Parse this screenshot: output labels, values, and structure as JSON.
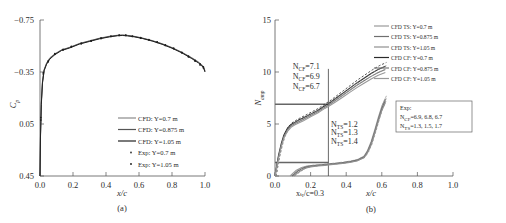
{
  "figure": {
    "caption_a": "(a)",
    "caption_b": "(b)"
  },
  "panel_a": {
    "name": "pressure-coefficient-plot",
    "ylabel": "C",
    "ylabel_sub": "p",
    "xlabel": "x/c",
    "yticks": [
      "0.45",
      "0.05",
      "−0.35",
      "−0.75"
    ],
    "xticks": [
      "0.0",
      "0.2",
      "0.4",
      "0.6",
      "0.8",
      "1.0"
    ],
    "legend": [
      {
        "label": "CFD: Y=0.7 m",
        "style": "line",
        "color": "#8a8a8a"
      },
      {
        "label": "CFD: Y=0.875 m",
        "style": "line",
        "color": "#555555"
      },
      {
        "label": "CFD: Y=1.05 m",
        "style": "line",
        "color": "#222222"
      },
      {
        "label": "Exp: Y=0.7 m",
        "style": "dot",
        "color": "#333333"
      },
      {
        "label": "Exp: Y=1.05 m",
        "style": "dot",
        "color": "#111111"
      }
    ]
  },
  "panel_b": {
    "name": "n-factor-amplification-plot",
    "ylabel": "N",
    "ylabel_sub": "amp",
    "xlabel": "x/c",
    "yticks": [
      "15",
      "10",
      "5",
      "0"
    ],
    "xticks": [
      "0.0",
      "0.2",
      "0.4",
      "0.6",
      "0.8",
      "1.0"
    ],
    "transition_annotation": "xₜᵣ/c=0.3",
    "ncf_annotations": [
      "N",
      "=7.1",
      "=6.9",
      "=6.7"
    ],
    "ncf_values": [
      "7.1",
      "6.9",
      "6.7"
    ],
    "nts_values": [
      "1.2",
      "1.3",
      "1.4"
    ],
    "ncf_sub": "CF",
    "nts_sub": "TS",
    "exp_box": {
      "title": "Exp:",
      "ncf_line": "=6.9, 6.8, 6.7",
      "nts_line": "=1.3, 1.5, 1.7",
      "ncf_label": "N",
      "nts_label": "N",
      "ncf_sub": "CF",
      "nts_sub": "TS"
    },
    "legend": [
      {
        "label": "CFD TS: Y=0.7 m",
        "color": "#9a9a9a"
      },
      {
        "label": "CFD TS: Y=0.875 m",
        "color": "#6f6f6f"
      },
      {
        "label": "CFD TS: Y=1.05 m",
        "color": "#8f8f8f"
      },
      {
        "label": "CFD CF: Y=0.7 m",
        "color": "#2a2a2a"
      },
      {
        "label": "CFD CF: Y=0.875 m",
        "color": "#777777"
      },
      {
        "label": "CFD CF: Y=1.05 m",
        "color": "#999999"
      }
    ]
  },
  "chart_data": [
    {
      "type": "line",
      "id": "panel-a",
      "title": "(a)",
      "xlabel": "x/c",
      "ylabel": "Cp",
      "xlim": [
        0.0,
        1.0
      ],
      "ylim": [
        -0.75,
        0.45
      ],
      "xticks": [
        0.0,
        0.2,
        0.4,
        0.6,
        0.8,
        1.0
      ],
      "yticks": [
        -0.75,
        -0.35,
        0.05,
        0.45
      ],
      "grid": false,
      "legend_position": "lower-right",
      "series": [
        {
          "name": "CFD: Y=0.7 m",
          "x": [
            0.0,
            0.003,
            0.008,
            0.015,
            0.025,
            0.04,
            0.06,
            0.09,
            0.13,
            0.18,
            0.24,
            0.3,
            0.36,
            0.42,
            0.47,
            0.5,
            0.53,
            0.57,
            0.62,
            0.68,
            0.74,
            0.8,
            0.86,
            0.92,
            0.96,
            0.99,
            1.0
          ],
          "y": [
            -0.75,
            -0.43,
            -0.18,
            -0.02,
            0.07,
            0.12,
            0.16,
            0.19,
            0.22,
            0.24,
            0.27,
            0.29,
            0.31,
            0.325,
            0.333,
            0.335,
            0.332,
            0.325,
            0.312,
            0.292,
            0.268,
            0.238,
            0.202,
            0.16,
            0.128,
            0.095,
            0.06
          ]
        },
        {
          "name": "CFD: Y=0.875 m",
          "x": [
            0.0,
            0.003,
            0.008,
            0.015,
            0.025,
            0.04,
            0.06,
            0.09,
            0.13,
            0.18,
            0.24,
            0.3,
            0.36,
            0.42,
            0.47,
            0.5,
            0.53,
            0.57,
            0.62,
            0.68,
            0.74,
            0.8,
            0.86,
            0.92,
            0.96,
            0.99,
            1.0
          ],
          "y": [
            -0.75,
            -0.44,
            -0.19,
            -0.03,
            0.065,
            0.115,
            0.155,
            0.187,
            0.218,
            0.238,
            0.268,
            0.288,
            0.308,
            0.322,
            0.331,
            0.333,
            0.33,
            0.323,
            0.31,
            0.29,
            0.266,
            0.236,
            0.2,
            0.157,
            0.124,
            0.09,
            0.055
          ]
        },
        {
          "name": "CFD: Y=1.05 m",
          "x": [
            0.0,
            0.003,
            0.008,
            0.015,
            0.025,
            0.04,
            0.06,
            0.09,
            0.13,
            0.18,
            0.24,
            0.3,
            0.36,
            0.42,
            0.47,
            0.5,
            0.53,
            0.57,
            0.62,
            0.68,
            0.74,
            0.8,
            0.86,
            0.92,
            0.96,
            0.99,
            1.0
          ],
          "y": [
            -0.75,
            -0.45,
            -0.2,
            -0.035,
            0.06,
            0.11,
            0.15,
            0.183,
            0.215,
            0.235,
            0.265,
            0.285,
            0.305,
            0.32,
            0.329,
            0.331,
            0.328,
            0.321,
            0.308,
            0.288,
            0.263,
            0.233,
            0.197,
            0.153,
            0.12,
            0.086,
            0.05
          ]
        },
        {
          "name": "Exp: Y=0.7 m",
          "marker": "dot",
          "x": [
            0.005,
            0.02,
            0.05,
            0.09,
            0.14,
            0.19,
            0.25,
            0.31,
            0.37,
            0.43,
            0.48,
            0.52,
            0.56,
            0.61,
            0.66,
            0.71,
            0.76,
            0.81,
            0.86,
            0.9,
            0.94,
            0.97,
            0.99
          ],
          "y": [
            -0.3,
            0.045,
            0.135,
            0.192,
            0.225,
            0.248,
            0.272,
            0.292,
            0.312,
            0.327,
            0.334,
            0.334,
            0.326,
            0.314,
            0.3,
            0.282,
            0.258,
            0.234,
            0.202,
            0.172,
            0.14,
            0.112,
            0.09
          ]
        },
        {
          "name": "Exp: Y=1.05 m",
          "marker": "dot",
          "x": [
            0.005,
            0.02,
            0.05,
            0.09,
            0.14,
            0.19,
            0.25,
            0.31,
            0.37,
            0.43,
            0.48,
            0.52,
            0.56,
            0.61,
            0.66,
            0.71,
            0.76,
            0.81,
            0.86,
            0.9,
            0.94,
            0.97,
            0.99
          ],
          "y": [
            -0.32,
            0.035,
            0.128,
            0.186,
            0.22,
            0.243,
            0.267,
            0.287,
            0.307,
            0.323,
            0.331,
            0.331,
            0.323,
            0.311,
            0.296,
            0.278,
            0.254,
            0.229,
            0.197,
            0.166,
            0.133,
            0.104,
            0.082
          ]
        }
      ]
    },
    {
      "type": "line",
      "id": "panel-b",
      "title": "(b)",
      "xlabel": "x/c",
      "ylabel": "N_amp",
      "xlim": [
        0.0,
        1.0
      ],
      "ylim": [
        0,
        15
      ],
      "xticks": [
        0.0,
        0.2,
        0.4,
        0.6,
        0.8,
        1.0
      ],
      "yticks": [
        0,
        5,
        10,
        15
      ],
      "grid": false,
      "legend_position": "upper-right",
      "annotations": [
        {
          "text": "N_CF=7.1",
          "x": 0.17,
          "y": 10.2
        },
        {
          "text": "N_CF=6.9",
          "x": 0.17,
          "y": 9.3
        },
        {
          "text": "N_CF=6.7",
          "x": 0.17,
          "y": 8.4
        },
        {
          "text": "N_TS=1.2",
          "x": 0.33,
          "y": 4.6
        },
        {
          "text": "N_TS=1.3",
          "x": 0.33,
          "y": 3.9
        },
        {
          "text": "N_TS=1.4",
          "x": 0.33,
          "y": 3.2
        },
        {
          "text": "x_tr/c=0.3",
          "x": 0.3,
          "y": -1.6
        }
      ],
      "reference_lines": [
        {
          "orientation": "vertical",
          "value": 0.3
        },
        {
          "orientation": "horizontal",
          "value": 6.9
        },
        {
          "orientation": "horizontal",
          "value": 1.3
        }
      ],
      "series": [
        {
          "name": "CFD CF: Y=0.7 m",
          "x": [
            0.0,
            0.01,
            0.02,
            0.035,
            0.05,
            0.07,
            0.09,
            0.11,
            0.13,
            0.16,
            0.2,
            0.24,
            0.28,
            0.3,
            0.34,
            0.38,
            0.42,
            0.46,
            0.5,
            0.54,
            0.58,
            0.62
          ],
          "y": [
            0.0,
            1.05,
            2.0,
            3.1,
            3.95,
            4.6,
            4.95,
            5.15,
            5.35,
            5.6,
            5.95,
            6.3,
            6.75,
            6.95,
            7.45,
            7.95,
            8.45,
            8.95,
            9.4,
            9.85,
            10.25,
            10.55
          ]
        },
        {
          "name": "CFD CF: Y=0.875 m",
          "x": [
            0.0,
            0.01,
            0.02,
            0.035,
            0.05,
            0.07,
            0.09,
            0.11,
            0.13,
            0.16,
            0.2,
            0.24,
            0.28,
            0.3,
            0.34,
            0.38,
            0.42,
            0.46,
            0.5,
            0.54,
            0.58,
            0.62
          ],
          "y": [
            0.0,
            0.95,
            1.85,
            2.95,
            3.8,
            4.45,
            4.82,
            5.02,
            5.2,
            5.45,
            5.82,
            6.18,
            6.62,
            6.8,
            7.28,
            7.76,
            8.24,
            8.72,
            9.15,
            9.58,
            9.95,
            10.25
          ]
        },
        {
          "name": "CFD CF: Y=1.05 m",
          "x": [
            0.0,
            0.01,
            0.02,
            0.035,
            0.05,
            0.07,
            0.09,
            0.11,
            0.13,
            0.16,
            0.2,
            0.24,
            0.28,
            0.3,
            0.34,
            0.38,
            0.42,
            0.46,
            0.5,
            0.54,
            0.58,
            0.62
          ],
          "y": [
            0.0,
            0.85,
            1.7,
            2.8,
            3.65,
            4.3,
            4.68,
            4.9,
            5.08,
            5.32,
            5.7,
            6.05,
            6.5,
            6.68,
            7.12,
            7.58,
            8.04,
            8.5,
            8.92,
            9.32,
            9.68,
            9.95
          ]
        },
        {
          "name": "CFD TS: Y=0.7 m",
          "x": [
            0.085,
            0.1,
            0.12,
            0.15,
            0.18,
            0.22,
            0.26,
            0.3,
            0.34,
            0.38,
            0.42,
            0.46,
            0.5,
            0.52,
            0.54,
            0.56,
            0.58,
            0.6,
            0.62
          ],
          "y": [
            0.0,
            0.25,
            0.55,
            0.82,
            0.95,
            1.02,
            1.08,
            1.15,
            1.22,
            1.3,
            1.4,
            1.55,
            1.9,
            2.45,
            3.3,
            4.4,
            5.6,
            6.7,
            7.45
          ]
        },
        {
          "name": "CFD TS: Y=0.875 m",
          "x": [
            0.095,
            0.11,
            0.13,
            0.16,
            0.19,
            0.23,
            0.27,
            0.3,
            0.34,
            0.38,
            0.42,
            0.46,
            0.5,
            0.52,
            0.54,
            0.56,
            0.58,
            0.6,
            0.62
          ],
          "y": [
            0.0,
            0.22,
            0.5,
            0.78,
            0.92,
            1.0,
            1.06,
            1.12,
            1.18,
            1.26,
            1.36,
            1.5,
            1.82,
            2.35,
            3.15,
            4.25,
            5.4,
            6.5,
            7.25
          ]
        },
        {
          "name": "CFD TS: Y=1.05 m",
          "x": [
            0.105,
            0.12,
            0.14,
            0.17,
            0.2,
            0.24,
            0.28,
            0.3,
            0.34,
            0.38,
            0.42,
            0.46,
            0.5,
            0.52,
            0.54,
            0.56,
            0.58,
            0.6,
            0.62
          ],
          "y": [
            0.0,
            0.2,
            0.46,
            0.74,
            0.88,
            0.96,
            1.02,
            1.07,
            1.13,
            1.2,
            1.3,
            1.44,
            1.75,
            2.25,
            3.0,
            4.1,
            5.25,
            6.3,
            7.05
          ]
        }
      ]
    }
  ]
}
